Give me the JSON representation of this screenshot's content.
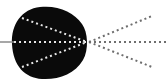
{
  "diagram": {
    "colors": {
      "background": "#ffffff",
      "blob": "#0a0a0a",
      "incoming_line": "#8a8a8a",
      "inner_rays": "#e6e6e6",
      "outer_rays": "#6e6e6e"
    },
    "blob_path": "M40 7 C58 5 74 12 82 24 C88 32 89 50 83 60 C75 74 58 80 42 79 C25 78 13 66 12 44 C11 24 22 9 40 7 Z",
    "focal_point": {
      "x": 88,
      "y": 42
    },
    "incoming_line": {
      "x1": 0,
      "y1": 42,
      "x2": 14,
      "y2": 42
    },
    "inner_rays": [
      {
        "x1": 22,
        "y1": 18,
        "x2": 87,
        "y2": 42
      },
      {
        "x1": 14,
        "y1": 42,
        "x2": 87,
        "y2": 42
      },
      {
        "x1": 22,
        "y1": 67,
        "x2": 87,
        "y2": 42
      }
    ],
    "outer_rays": [
      {
        "x1": 89,
        "y1": 42,
        "x2": 152,
        "y2": 16
      },
      {
        "x1": 89,
        "y1": 42,
        "x2": 168,
        "y2": 42
      },
      {
        "x1": 89,
        "y1": 42,
        "x2": 152,
        "y2": 67
      }
    ]
  }
}
